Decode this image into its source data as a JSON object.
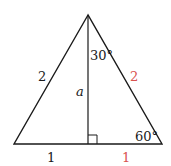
{
  "diagram": {
    "type": "triangle",
    "labels": {
      "left_side": "2",
      "right_side": "2",
      "altitude": "a",
      "apex_angle": "30°",
      "base_angle": "60°",
      "base_left": "1",
      "base_right": "1"
    },
    "colors": {
      "line": "#1a1a1a",
      "text": "#1a1a1a",
      "highlight": "#d9534f"
    }
  }
}
